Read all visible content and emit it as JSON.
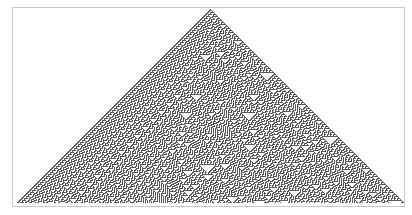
{
  "figure": {
    "rule": 30,
    "steps": 194,
    "initial_condition": "single black cell",
    "apex": {
      "x": 210,
      "y": 9
    },
    "cell_size": 1,
    "colors": {
      "on": "#5a5a5a",
      "off": "#ffffff",
      "frame": "#c8c8c8",
      "background": "#ffffff"
    }
  }
}
